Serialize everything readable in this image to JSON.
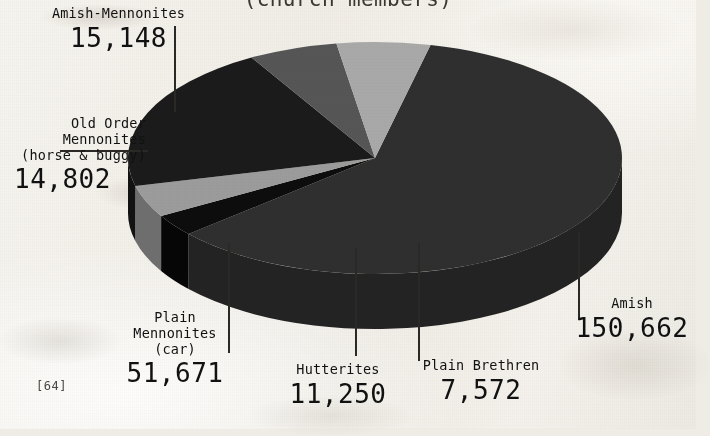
{
  "page": {
    "page_number": "[64]",
    "background_color": "#efece6"
  },
  "chart_data": {
    "type": "pie",
    "title": "(church members)",
    "subtitle": "",
    "xlabel": "",
    "ylabel": "",
    "total": 251105,
    "legend_position": "callout-labels",
    "grid": false,
    "three_d": true,
    "categories": [
      "Amish",
      "Plain Brethren",
      "Hutterites",
      "Plain Mennonites (car)",
      "Old Order Mennonites (horse & buggy)",
      "Amish-Mennonites"
    ],
    "values": [
      150662,
      7572,
      11250,
      51671,
      14802,
      15148
    ],
    "value_labels": [
      "150,662",
      "7,572",
      "11,250",
      "51,671",
      "14,802",
      "15,148"
    ],
    "colors": [
      "#2f2f2f",
      "#0d0d0d",
      "#9c9c9c",
      "#1b1b1b",
      "#565656",
      "#a9a9a9"
    ],
    "slices": [
      {
        "name": "Amish",
        "name_lines": "Amish",
        "value": 150662,
        "value_label": "150,662",
        "color": "#2f2f2f",
        "side_color": "#232323",
        "percent": 60.0,
        "start_angle_deg": -77,
        "end_angle_deg": 139
      },
      {
        "name": "Plain Brethren",
        "name_lines": "Plain Brethren",
        "value": 7572,
        "value_label": "7,572",
        "color": "#0d0d0d",
        "side_color": "#060606",
        "percent": 3.0,
        "start_angle_deg": 139,
        "end_angle_deg": 150
      },
      {
        "name": "Hutterites",
        "name_lines": "Hutterites",
        "value": 11250,
        "value_label": "11,250",
        "color": "#9c9c9c",
        "side_color": "#6f6f6f",
        "percent": 4.5,
        "start_angle_deg": 150,
        "end_angle_deg": 166
      },
      {
        "name": "Plain Mennonites (car)",
        "name_lines": "Plain\nMennonites\n(car)",
        "value": 51671,
        "value_label": "51,671",
        "color": "#1b1b1b",
        "side_color": "#121212",
        "percent": 20.6,
        "start_angle_deg": 166,
        "end_angle_deg": 240
      },
      {
        "name": "Old Order Mennonites (horse & buggy)",
        "name_lines": "Old Order\nMennonites  —\n(horse & buggy)",
        "value": 14802,
        "value_label": "14,802",
        "color": "#565656",
        "side_color": "#3c3c3c",
        "percent": 5.9,
        "start_angle_deg": 240,
        "end_angle_deg": 261
      },
      {
        "name": "Amish-Mennonites",
        "name_lines": "Amish-Mennonites",
        "value": 15148,
        "value_label": "15,148",
        "color": "#a9a9a9",
        "side_color": "#787878",
        "percent": 6.0,
        "start_angle_deg": 261,
        "end_angle_deg": 283
      }
    ]
  },
  "labels": {
    "amish_mennonites": {
      "name": "Amish-Mennonites",
      "value": "15,148"
    },
    "old_order": {
      "name_l1": "Old Order",
      "name_l2": "Mennonites",
      "name_l3": "(horse & buggy)",
      "value": "14,802"
    },
    "plain_mennonites": {
      "name_l1": "Plain",
      "name_l2": "Mennonites",
      "name_l3": "(car)",
      "value": "51,671"
    },
    "hutterites": {
      "name": "Hutterites",
      "value": "11,250"
    },
    "plain_brethren": {
      "name": "Plain Brethren",
      "value": "7,572"
    },
    "amish": {
      "name": "Amish",
      "value": "150,662"
    }
  }
}
